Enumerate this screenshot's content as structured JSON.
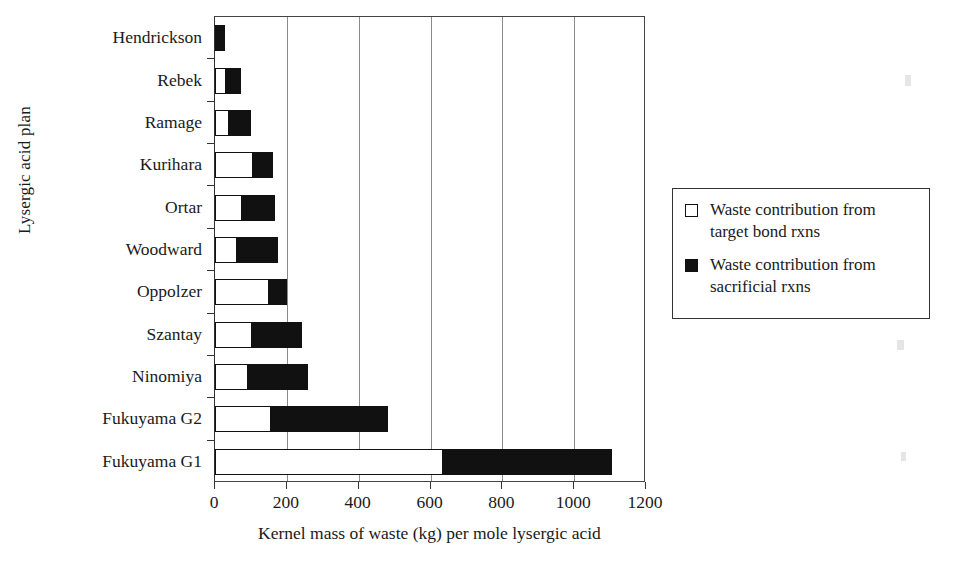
{
  "chart_data": {
    "type": "bar",
    "orientation": "horizontal",
    "stacked": true,
    "title": "",
    "xlabel": "Kernel mass of waste (kg) per mole lysergic acid",
    "ylabel": "Lysergic acid plan",
    "xlim": [
      0,
      1200
    ],
    "xticks": [
      0,
      200,
      400,
      600,
      800,
      1000,
      1200
    ],
    "xtick_labels": [
      "0",
      "200",
      "400",
      "600",
      "800",
      "1000",
      "1200"
    ],
    "grid": "vertical",
    "legend_position": "right",
    "categories": [
      "Hendrickson",
      "Rebek",
      "Ramage",
      "Kurihara",
      "Ortar",
      "Woodward",
      "Oppolzer",
      "Szantay",
      "Ninomiya",
      "Fukuyama G2",
      "Fukuyama G1"
    ],
    "series": [
      {
        "name": "Waste contribution from target bond rxns",
        "color": "#ffffff",
        "values": [
          5,
          31,
          39,
          106,
          76,
          62,
          151,
          103,
          92,
          157,
          635
        ]
      },
      {
        "name": "Waste contribution from sacrificial rxns",
        "color": "#111111",
        "values": [
          23,
          42,
          61,
          56,
          92,
          114,
          50,
          140,
          168,
          324,
          470
        ]
      }
    ],
    "totals": [
      28,
      73,
      100,
      162,
      168,
      176,
      201,
      243,
      260,
      481,
      1105
    ]
  },
  "legend": {
    "entries": [
      {
        "label": "Waste contribution from target bond rxns",
        "swatch": "open-square-swatch"
      },
      {
        "label": "Waste contribution from sacrificial rxns",
        "swatch": "filled-square-swatch"
      }
    ]
  },
  "axes": {
    "y_title": "Lysergic acid plan",
    "x_title": "Kernel mass of waste (kg) per mole lysergic acid"
  }
}
